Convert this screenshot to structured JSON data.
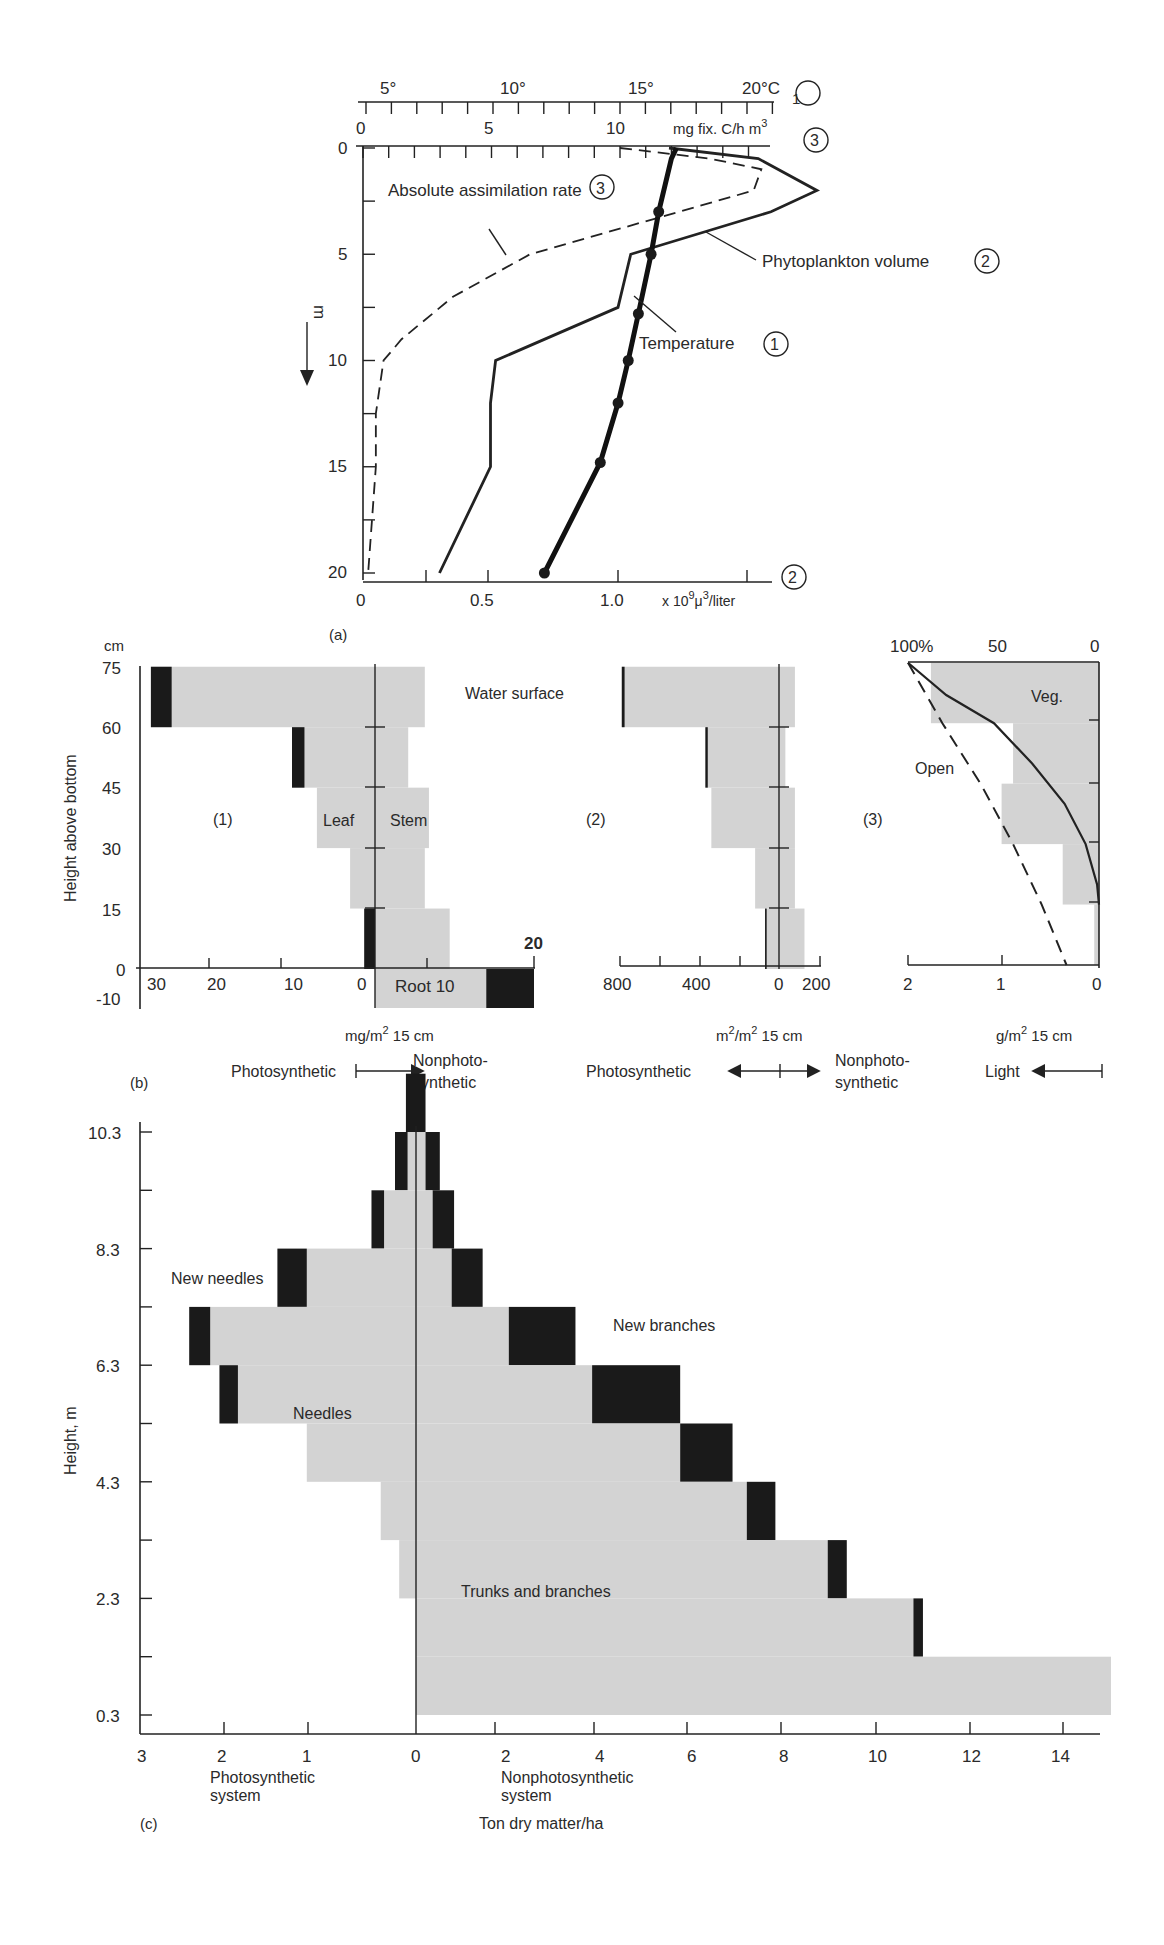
{
  "chart_data": [
    {
      "panel": "a",
      "type": "line",
      "label": "(a)",
      "y_axis": {
        "label": "m",
        "direction": "down",
        "ticks": [
          0,
          5,
          10,
          15,
          20
        ],
        "range": [
          0,
          20
        ]
      },
      "x_axes": [
        {
          "id": "1",
          "label": "20°C",
          "unit": "°C",
          "ticks": [
            "5°",
            "10°",
            "15°",
            "20°C"
          ],
          "marker": "1",
          "position": "top"
        },
        {
          "id": "3",
          "label": "mg fix. C/h m³",
          "ticks": [
            "0",
            "5",
            "10"
          ],
          "marker": "3",
          "position": "top"
        },
        {
          "id": "2",
          "label": "x 10⁹μ³/liter",
          "ticks": [
            "0",
            "0.5",
            "1.0"
          ],
          "marker": "2",
          "position": "bottom"
        }
      ],
      "series": [
        {
          "name": "Absolute assimilation rate",
          "marker": "3",
          "style": "dashed",
          "axis": "3",
          "points": [
            [
              10.0,
              0
            ],
            [
              13.5,
              0.5
            ],
            [
              15.5,
              1
            ],
            [
              15.2,
              2
            ],
            [
              6.5,
              5
            ],
            [
              3.5,
              7
            ],
            [
              1.5,
              9
            ],
            [
              0.8,
              10
            ],
            [
              0.5,
              12.5
            ],
            [
              0.5,
              15
            ],
            [
              0.2,
              20
            ]
          ]
        },
        {
          "name": "Phytoplankton volume",
          "marker": "2",
          "style": "solid",
          "axis": "2",
          "points": [
            [
              1.2,
              0
            ],
            [
              1.55,
              0.5
            ],
            [
              1.78,
              2
            ],
            [
              1.6,
              3
            ],
            [
              1.05,
              5
            ],
            [
              1.0,
              7.5
            ],
            [
              0.52,
              10
            ],
            [
              0.5,
              12
            ],
            [
              0.5,
              15
            ],
            [
              0.3,
              20
            ]
          ]
        },
        {
          "name": "Temperature",
          "marker": "1",
          "style": "bold-with-dots",
          "axis": "1",
          "points": [
            [
              16.2,
              0
            ],
            [
              16.0,
              0.5
            ],
            [
              15.5,
              3
            ],
            [
              15.2,
              5
            ],
            [
              14.7,
              7.8
            ],
            [
              14.3,
              10
            ],
            [
              13.9,
              12
            ],
            [
              13.2,
              14.8
            ],
            [
              11.0,
              20
            ]
          ]
        }
      ]
    },
    {
      "panel": "b1",
      "type": "bar",
      "label": "(1)",
      "title": "",
      "ylabel": "Height above bottom",
      "yunit": "cm",
      "yticks": [
        "75",
        "60",
        "45",
        "30",
        "15",
        "0",
        "-10"
      ],
      "xticks_left": [
        "30",
        "20",
        "10",
        "0"
      ],
      "xticks_right": [
        "10",
        "20"
      ],
      "xunit": "mg/m² 15 cm",
      "annotations": [
        "Leaf",
        "Stem",
        "Root 10",
        "Water surface"
      ],
      "layers": [
        {
          "range_cm": [
            60,
            75
          ],
          "leaf": 27,
          "leaf_new": 2.5,
          "stem": 6
        },
        {
          "range_cm": [
            45,
            60
          ],
          "leaf": 10,
          "leaf_new": 1.5,
          "stem": 4
        },
        {
          "range_cm": [
            30,
            45
          ],
          "leaf": 7,
          "leaf_new": 0,
          "stem": 6.5
        },
        {
          "range_cm": [
            15,
            30
          ],
          "leaf": 3,
          "leaf_new": 0,
          "stem": 6
        },
        {
          "range_cm": [
            0,
            15
          ],
          "leaf": 1.3,
          "leaf_new": 1.3,
          "stem": 9
        },
        {
          "range_cm": [
            -10,
            0
          ],
          "root": 20,
          "root_black_from": 14
        }
      ],
      "legend": {
        "left": "Photosynthetic",
        "right": "Nonphotosynthetic"
      }
    },
    {
      "panel": "b2",
      "type": "bar",
      "label": "(2)",
      "xticks": [
        "800",
        "400",
        "0",
        "200"
      ],
      "xunit": "m²/m² 15 cm",
      "layers": [
        {
          "range_cm": [
            60,
            75
          ],
          "photo": 790,
          "photo_new": 70,
          "nonphoto": 50
        },
        {
          "range_cm": [
            45,
            60
          ],
          "photo": 370,
          "photo_new": 60,
          "nonphoto": 20
        },
        {
          "range_cm": [
            30,
            45
          ],
          "photo": 340,
          "photo_new": 0,
          "nonphoto": 50
        },
        {
          "range_cm": [
            15,
            30
          ],
          "photo": 120,
          "photo_new": 0,
          "nonphoto": 50
        },
        {
          "range_cm": [
            0,
            15
          ],
          "photo": 70,
          "photo_new": 40,
          "nonphoto": 80
        }
      ],
      "legend": {
        "left": "Photosynthetic",
        "right": "Nonphotosynthetic"
      }
    },
    {
      "panel": "b3",
      "type": "line",
      "label": "(3)",
      "top_ticks": [
        "100%",
        "50",
        "0"
      ],
      "bottom_ticks": [
        "2",
        "1",
        "0"
      ],
      "xunit": "g/m² 15 cm",
      "annotations": [
        "Veg.",
        "Open"
      ],
      "bars_g": [
        [
          60,
          75,
          1.76
        ],
        [
          45,
          60,
          0.9
        ],
        [
          30,
          45,
          1.02
        ],
        [
          15,
          30,
          0.38
        ],
        [
          0,
          15,
          0.05
        ]
      ],
      "series": [
        {
          "name": "Veg.",
          "style": "solid",
          "points_pct_cm": [
            [
              100,
              75
            ],
            [
              80,
              67
            ],
            [
              55,
              60
            ],
            [
              35,
              50
            ],
            [
              18,
              40
            ],
            [
              7,
              30
            ],
            [
              1,
              20
            ],
            [
              0,
              15
            ]
          ]
        },
        {
          "name": "Open",
          "style": "dashed",
          "points_pct_cm": [
            [
              100,
              75
            ],
            [
              82,
              60
            ],
            [
              62,
              45
            ],
            [
              45,
              30
            ],
            [
              30,
              15
            ],
            [
              17,
              0
            ]
          ]
        }
      ],
      "legend": {
        "right": "Light"
      }
    },
    {
      "panel": "c",
      "type": "bar",
      "label": "(c)",
      "ylabel": "Height, m",
      "yticks": [
        "10.3",
        "8.3",
        "6.3",
        "4.3",
        "2.3",
        "0.3"
      ],
      "xticks_left": [
        "3",
        "2",
        "1",
        "0"
      ],
      "xticks_right": [
        "2",
        "4",
        "6",
        "8",
        "10",
        "12",
        "14"
      ],
      "xlabel": "Ton dry matter/ha",
      "left_label": "Photosynthetic system",
      "right_label": "Nonphotosynthetic system",
      "annotations": [
        "New needles",
        "Needles",
        "New branches",
        "Trunks and branches"
      ],
      "layers": [
        {
          "height_m": [
            10.3,
            11.3
          ],
          "needles": 0,
          "new_needles": 0.12,
          "branches": 0,
          "new_branches": 0.2
        },
        {
          "height_m": [
            9.3,
            10.3
          ],
          "needles": 0.1,
          "new_needles": 0.15,
          "branches": 0.2,
          "new_branches": 0.3
        },
        {
          "height_m": [
            8.3,
            9.3
          ],
          "needles": 0.38,
          "new_needles": 0.15,
          "branches": 0.35,
          "new_branches": 0.45
        },
        {
          "height_m": [
            7.3,
            8.3
          ],
          "needles": 1.3,
          "new_needles": 0.35,
          "branches": 0.75,
          "new_branches": 0.65
        },
        {
          "height_m": [
            6.3,
            7.3
          ],
          "needles": 2.45,
          "new_needles": 0.25,
          "branches": 1.95,
          "new_branches": 1.4
        },
        {
          "height_m": [
            5.3,
            6.3
          ],
          "needles": 2.12,
          "new_needles": 0.22,
          "branches": 3.7,
          "new_branches": 1.85
        },
        {
          "height_m": [
            4.3,
            5.3
          ],
          "needles": 1.3,
          "new_needles": 0,
          "branches": 5.55,
          "new_branches": 1.1
        },
        {
          "height_m": [
            3.3,
            4.3
          ],
          "needles": 0.42,
          "new_needles": 0,
          "branches": 6.95,
          "new_branches": 0.6
        },
        {
          "height_m": [
            2.3,
            3.3
          ],
          "needles": 0.2,
          "new_needles": 0,
          "branches": 8.65,
          "new_branches": 0.4
        },
        {
          "height_m": [
            1.3,
            2.3
          ],
          "needles": 0,
          "new_needles": 0,
          "branches": 10.45,
          "new_branches": 0.2
        },
        {
          "height_m": [
            0.3,
            1.3
          ],
          "needles": 0,
          "new_needles": 0,
          "branches": 14.6,
          "new_branches": 0
        }
      ]
    }
  ],
  "text": {
    "a": {
      "temp_ticks": [
        "5°",
        "10°",
        "15°",
        "20°C"
      ],
      "marker1": "1",
      "mg_ticks": [
        "0",
        "5",
        "10"
      ],
      "mg_unit": "mg fix. C/h m",
      "mg_unit_sup": "3",
      "marker3": "3",
      "depth_ticks": [
        "0",
        "5",
        "10",
        "15",
        "20"
      ],
      "depth_unit": "m",
      "label_assim": "Absolute assimilation rate",
      "label_phyto": "Phytoplankton volume",
      "label_temp": "Temperature",
      "vol_ticks": [
        "0",
        "0.5",
        "1.0"
      ],
      "vol_unit_prefix": "x 10",
      "vol_unit_sup1": "9",
      "vol_unit_mu": "μ",
      "vol_unit_sup2": "3",
      "vol_unit_suffix": "/liter",
      "marker2": "2",
      "panel_label": "(a)"
    },
    "b": {
      "cm": "cm",
      "ylabel": "Height above bottom",
      "yticks": [
        "75",
        "60",
        "45",
        "30",
        "15",
        "0",
        "-10"
      ],
      "p1": "(1)",
      "leaf": "Leaf",
      "stem": "Stem",
      "water": "Water surface",
      "root": "Root 10",
      "tick20": "20",
      "x1_ticks": [
        "30",
        "20",
        "10",
        "0"
      ],
      "unit1": "mg/m",
      "unit1_sup": "2",
      "unit1_tail": " 15 cm",
      "photosynthetic": "Photosynthetic",
      "nonphoto1": "Nonphoto-",
      "nonphoto2": "synthetic",
      "panel_label": "(b)",
      "p2": "(2)",
      "x2_ticks": [
        "800",
        "400",
        "0",
        "200"
      ],
      "unit2a": "m",
      "unit2_sup1": "2",
      "unit2b": "/m",
      "unit2_sup2": "2",
      "unit2_tail": " 15 cm",
      "p3": "(3)",
      "top3_ticks": [
        "100%",
        "50",
        "0"
      ],
      "veg": "Veg.",
      "open": "Open",
      "x3_ticks": [
        "2",
        "1",
        "0"
      ],
      "unit3": "g/m",
      "unit3_sup": "2",
      "unit3_tail": " 15 cm",
      "light": "Light"
    },
    "c": {
      "ylabel": "Height, m",
      "yticks": [
        "10.3",
        "8.3",
        "6.3",
        "4.3",
        "2.3",
        "0.3"
      ],
      "new_needles": "New needles",
      "needles": "Needles",
      "new_branches": "New branches",
      "trunks": "Trunks and branches",
      "xticks": [
        "3",
        "2",
        "1",
        "0",
        "2",
        "4",
        "6",
        "8",
        "10",
        "12",
        "14"
      ],
      "photo1": "Photosynthetic",
      "photo2": "system",
      "nonphoto1": "Nonphotosynthetic",
      "nonphoto2": "system",
      "xlabel": "Ton dry matter/ha",
      "panel_label": "(c)"
    }
  },
  "colors": {
    "gray": "#d3d3d3",
    "black": "#1a1a1a",
    "ink": "#222222",
    "bg": "#ffffff"
  }
}
